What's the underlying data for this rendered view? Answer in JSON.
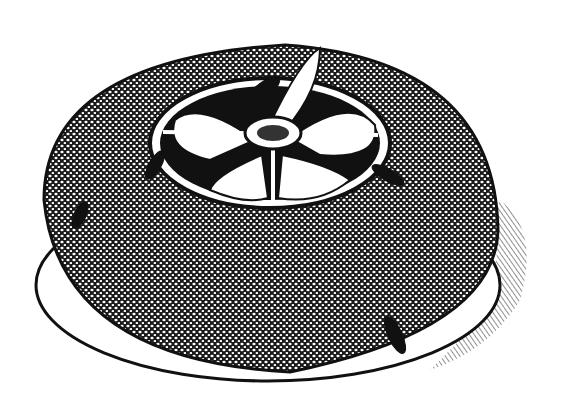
{
  "image": {
    "subject": "engraved illustration of a dome-shaped insect trap with cockroaches",
    "style": "black and white stipple engraving",
    "colors": {
      "ink": "#111111",
      "paper": "#ffffff",
      "stipple": "#2a2a2a"
    },
    "elements": [
      "dome-body",
      "base-rim",
      "top-opening",
      "four-funnel-vanes",
      "center-hub",
      "cockroach-x5",
      "shadow-hatching"
    ],
    "insect_count": 5
  }
}
